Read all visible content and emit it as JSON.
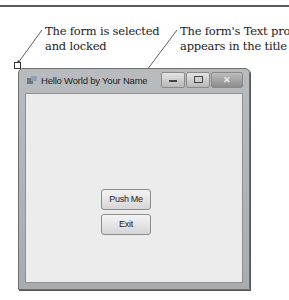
{
  "annotations": {
    "left": {
      "line1": "The form is selected",
      "line2": "and locked"
    },
    "right": {
      "line1": "The form's Text property",
      "line2": "appears in the title bar"
    }
  },
  "form": {
    "title": "Hello World by Your Name",
    "icon": "app-form-icon",
    "controls": {
      "minimize": "minimize-icon",
      "maximize": "maximize-icon",
      "close": "✕"
    },
    "buttons": [
      {
        "label": "Push Me"
      },
      {
        "label": "Exit"
      }
    ]
  },
  "colors": {
    "frame": "#b3b6b8",
    "client": "#ececec",
    "button": "#e4e4e4"
  }
}
